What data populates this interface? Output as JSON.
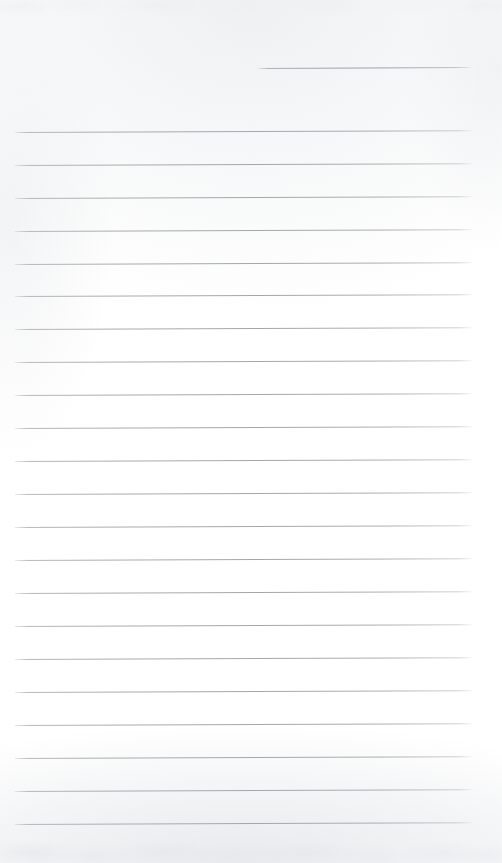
{
  "document": {
    "kind": "scanned-ruled-notepad-page",
    "title": "",
    "body_text": "",
    "page_width": 502,
    "page_height": 863
  },
  "paper": {
    "background_color": "#fefefe",
    "edge_shadow_color": "#e9ebee",
    "rule_color": "#a3a6ac",
    "rule_thickness_px": 1
  },
  "header_rule": {
    "name": "top-right-entry-rule",
    "label": "",
    "x": 258,
    "y": 68,
    "width": 214,
    "skew_deg": -0.25
  },
  "ruled_lines": {
    "count": 22,
    "left_x": 15,
    "right_x": 472,
    "width": 457,
    "first_y": 132,
    "spacing": 32.95,
    "skew_deg": -0.22,
    "y_positions": [
      132,
      165,
      198,
      231,
      264,
      296,
      329,
      362,
      395,
      428,
      461,
      494,
      527,
      560,
      593,
      626,
      659,
      692,
      725,
      758,
      791,
      824
    ],
    "labels": [
      "",
      "",
      "",
      "",
      "",
      "",
      "",
      "",
      "",
      "",
      "",
      "",
      "",
      "",
      "",
      "",
      "",
      "",
      "",
      "",
      "",
      ""
    ]
  },
  "scan_artifacts": {
    "top_band_label": "top-edge-scan-noise",
    "bottom_band_label": "bottom-edge-scan-noise"
  }
}
